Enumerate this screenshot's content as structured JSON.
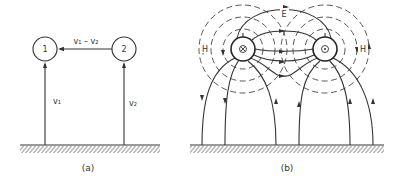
{
  "figure": {
    "panel_a": {
      "caption": "(a)",
      "conductor_1_label": "1",
      "conductor_2_label": "2",
      "relative_velocity_label": "v₁ – v₂",
      "velocity_1_label": "v₁",
      "velocity_2_label": "v₂"
    },
    "panel_b": {
      "caption": "(b)",
      "electric_field_label": "E",
      "magnetic_field_left_label": "H",
      "magnetic_field_right_label": "H",
      "left_conductor_symbol": "current-into-page-icon",
      "right_conductor_symbol": "current-out-of-page-icon"
    },
    "colors": {
      "ink": "#333333",
      "background": "#ffffff"
    }
  }
}
